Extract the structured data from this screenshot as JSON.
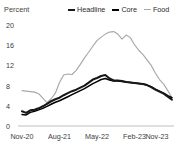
{
  "chart_data": {
    "type": "line",
    "title": "",
    "subtitle": "",
    "unit_label": "Percent",
    "xlabel": "",
    "ylabel": "Percent",
    "ylim": [
      0,
      20
    ],
    "yticks": [
      0,
      4,
      8,
      12,
      16,
      20
    ],
    "ytick_labels": [
      "0",
      "4",
      "8",
      "12",
      "16",
      "20"
    ],
    "grid": false,
    "legend_position": "top-right",
    "xtick_labels": [
      "Nov-20",
      "Aug-21",
      "May-22",
      "Feb-23",
      "Nov-23"
    ],
    "xtick_indices": [
      0,
      9,
      18,
      27,
      36
    ],
    "x": [
      "Nov-20",
      "Dec-20",
      "Jan-21",
      "Feb-21",
      "Mar-21",
      "Apr-21",
      "May-21",
      "Jun-21",
      "Jul-21",
      "Aug-21",
      "Sep-21",
      "Oct-21",
      "Nov-21",
      "Dec-21",
      "Jan-22",
      "Feb-22",
      "Mar-22",
      "Apr-22",
      "May-22",
      "Jun-22",
      "Jul-22",
      "Aug-22",
      "Sep-22",
      "Oct-22",
      "Nov-22",
      "Dec-22",
      "Jan-23",
      "Feb-23",
      "Mar-23",
      "Apr-23",
      "May-23",
      "Jun-23",
      "Jul-23",
      "Aug-23",
      "Sep-23",
      "Oct-23",
      "Nov-23"
    ],
    "series": [
      {
        "name": "Headline",
        "color": "#171717",
        "values": [
          2.9,
          2.6,
          3.1,
          3.2,
          3.5,
          3.9,
          4.4,
          4.9,
          5.3,
          5.6,
          6.1,
          6.5,
          6.9,
          7.2,
          7.6,
          8.0,
          8.6,
          9.2,
          9.5,
          9.9,
          10.1,
          9.4,
          9.0,
          9.0,
          8.9,
          8.7,
          8.6,
          8.5,
          8.4,
          8.3,
          8.1,
          7.7,
          7.2,
          6.8,
          6.4,
          5.8,
          5.2
        ]
      },
      {
        "name": "Core",
        "color": "#000000",
        "values": [
          2.3,
          2.2,
          2.7,
          2.9,
          3.2,
          3.5,
          3.9,
          4.3,
          4.7,
          5.0,
          5.4,
          5.8,
          6.2,
          6.6,
          7.0,
          7.4,
          7.9,
          8.4,
          8.8,
          9.2,
          9.4,
          9.1,
          8.9,
          8.9,
          8.8,
          8.7,
          8.6,
          8.5,
          8.4,
          8.3,
          8.1,
          7.8,
          7.3,
          6.9,
          6.5,
          6.0,
          5.6
        ]
      },
      {
        "name": "Food",
        "color": "#a8a8a8",
        "values": [
          7.0,
          6.9,
          6.8,
          6.7,
          6.4,
          5.5,
          4.6,
          5.4,
          6.5,
          8.6,
          10.1,
          10.3,
          10.2,
          11.0,
          12.2,
          13.5,
          14.6,
          15.8,
          16.9,
          17.6,
          18.2,
          18.6,
          18.7,
          18.2,
          17.2,
          18.0,
          17.5,
          16.1,
          15.0,
          14.2,
          13.1,
          12.0,
          10.5,
          9.2,
          8.3,
          7.0,
          5.6
        ]
      }
    ]
  },
  "axes": {
    "unit_label": "Percent"
  }
}
